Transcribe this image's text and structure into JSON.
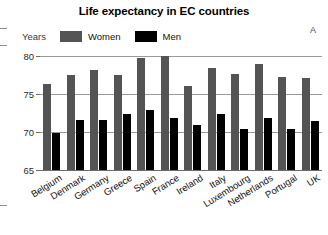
{
  "figure": {
    "title": "Life expectancy in EC countries",
    "panel_letter": "A",
    "axis_units_label": "Years",
    "colors": {
      "women": "#545454",
      "men": "#000000",
      "gridline": "#9a9a9a",
      "axis": "#6d6d6d",
      "background": "#ffffff",
      "text": "#111111"
    }
  },
  "legend": {
    "position": "top-left",
    "entries": [
      {
        "label": "Women",
        "color": "#545454",
        "swatch": "filled-rect"
      },
      {
        "label": "Men",
        "color": "#000000",
        "swatch": "filled-rect"
      }
    ]
  },
  "yaxis": {
    "ticks": [
      "80",
      "75",
      "70",
      "65"
    ],
    "tick_values": [
      80,
      75,
      70,
      65
    ],
    "min": 65,
    "max": 80,
    "label": "Years"
  },
  "chart_data": {
    "type": "bar",
    "title": "Life expectancy in EC countries",
    "xlabel": "",
    "ylabel": "Years",
    "ylim": [
      65,
      80
    ],
    "yticks": [
      65,
      70,
      75,
      80
    ],
    "grid": true,
    "legend_position": "top-left",
    "annotations": [
      "A"
    ],
    "categories": [
      "Belgium",
      "Denmark",
      "Germany",
      "Greece",
      "Spain",
      "France",
      "Ireland",
      "Italy",
      "Luxembourg",
      "Netherlands",
      "Portugal",
      "UK"
    ],
    "series": [
      {
        "name": "Women",
        "color": "#545454",
        "values": [
          76.3,
          77.5,
          78.2,
          77.5,
          79.8,
          80.0,
          76.0,
          78.4,
          77.6,
          78.9,
          77.3,
          77.1
        ]
      },
      {
        "name": "Men",
        "color": "#000000",
        "values": [
          69.9,
          71.6,
          71.6,
          72.4,
          72.9,
          71.9,
          70.9,
          72.4,
          70.4,
          71.9,
          70.4,
          71.5
        ]
      }
    ]
  }
}
